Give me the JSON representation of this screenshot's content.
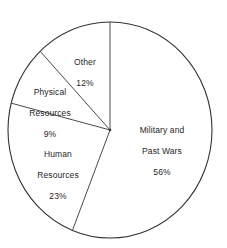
{
  "chart_data": {
    "type": "pie",
    "title": "",
    "subtitle": "",
    "xlabel": "",
    "ylabel": "",
    "legend_position": "none",
    "grid": false,
    "start_angle_deg": 0,
    "direction": "clockwise",
    "categories": [
      "Military and Past Wars",
      "Human Resources",
      "Physical Resources",
      "Other"
    ],
    "values": [
      56,
      23,
      9,
      12
    ],
    "unit": "%",
    "slices": [
      {
        "name": "Military and Past Wars",
        "name_line1": "Military and",
        "name_line2": "Past Wars",
        "value": 56,
        "value_label": "56%",
        "start_deg": 0,
        "end_deg": 201.6,
        "fill": "#ffffff",
        "stroke": "#333333"
      },
      {
        "name": "Human Resources",
        "name_line1": "Human",
        "name_line2": "Resources",
        "value": 23,
        "value_label": "23%",
        "start_deg": 201.6,
        "end_deg": 284.4,
        "fill": "#ffffff",
        "stroke": "#333333"
      },
      {
        "name": "Physical Resources",
        "name_line1": "Physical",
        "name_line2": "Resources",
        "value": 9,
        "value_label": "9%",
        "start_deg": 284.4,
        "end_deg": 316.8,
        "fill": "#ffffff",
        "stroke": "#333333"
      },
      {
        "name": "Other",
        "name_line1": "Other",
        "name_line2": "",
        "value": 12,
        "value_label": "12%",
        "start_deg": 316.8,
        "end_deg": 360,
        "fill": "#ffffff",
        "stroke": "#333333"
      }
    ],
    "geometry": {
      "center_x": 110,
      "center_y": 130,
      "radius_x": 102,
      "radius_y": 108
    }
  },
  "colors": {
    "background": "#ffffff",
    "outline": "#333333",
    "divider": "#4a4a4a",
    "text": "#262626"
  }
}
